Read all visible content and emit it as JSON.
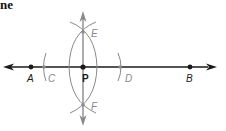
{
  "heading": "ne",
  "diagram": {
    "type": "geometric-construction",
    "colors": {
      "line": "#1a1a1a",
      "construction": "#8a8a8a",
      "label_dark": "#1a1a1a",
      "label_gray": "#8a8a8a"
    },
    "points": {
      "A": {
        "label": "A",
        "x": 31,
        "y": 67
      },
      "C": {
        "label": "C",
        "x": 44,
        "y": 67
      },
      "P": {
        "label": "P",
        "x": 83,
        "y": 67
      },
      "D": {
        "label": "D",
        "x": 120,
        "y": 67
      },
      "B": {
        "label": "B",
        "x": 190,
        "y": 67
      },
      "E": {
        "label": "E",
        "x": 83,
        "y": 32
      },
      "F": {
        "label": "F",
        "x": 83,
        "y": 105
      }
    }
  }
}
